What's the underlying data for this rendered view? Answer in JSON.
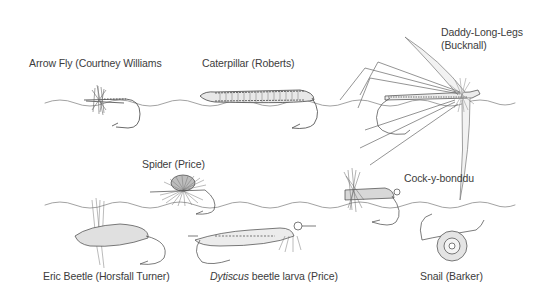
{
  "water_line_color": "#9a9a9a",
  "ink_color": "#333333",
  "flies": [
    {
      "id": "arrow-fly",
      "name": "Arrow Fly (Courtney Williams",
      "row": "top"
    },
    {
      "id": "caterpillar",
      "name": "Caterpillar (Roberts)",
      "row": "top"
    },
    {
      "id": "daddy-long-legs",
      "name_line1": "Daddy-Long-Legs",
      "name_line2": "(Bucknall)",
      "row": "top"
    },
    {
      "id": "spider",
      "name": "Spider (Price)",
      "row": "middle"
    },
    {
      "id": "cock-y-bonddu",
      "name": "Cock-y-bonddu",
      "row": "middle"
    },
    {
      "id": "eric-beetle",
      "name": "Eric Beetle (Horsfall Turner)",
      "row": "bottom"
    },
    {
      "id": "dytiscus-larva",
      "name_italic": "Dytiscus",
      "name_rest": " beetle larva (Price)",
      "row": "bottom"
    },
    {
      "id": "snail",
      "name": "Snail (Barker)",
      "row": "bottom"
    }
  ]
}
